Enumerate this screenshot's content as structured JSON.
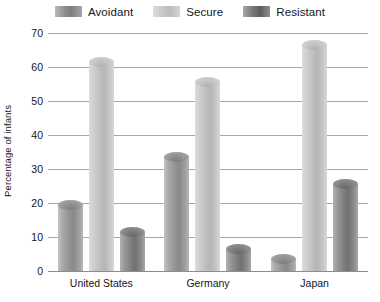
{
  "chart_data": {
    "type": "bar",
    "title": "",
    "subtitle": "",
    "xlabel": "",
    "ylabel": "Percentage of infants",
    "categories": [
      "United States",
      "Germany",
      "Japan"
    ],
    "series": [
      {
        "name": "Avoidant",
        "values": [
          21,
          35,
          5
        ]
      },
      {
        "name": "Secure",
        "values": [
          63,
          57,
          68
        ]
      },
      {
        "name": "Resistant",
        "values": [
          13,
          8,
          27
        ]
      }
    ],
    "ylim": [
      0,
      70
    ],
    "yticks": [
      70,
      60,
      50,
      40,
      30,
      20,
      10,
      0
    ],
    "grid": true,
    "legend_position": "top-center",
    "bar_style": "3d-cylinder",
    "colors": {
      "Avoidant": "#8f8f8f",
      "Secure": "#c4c4c4",
      "Resistant": "#767676",
      "gridline": "#a7a7a7",
      "text": "#161616",
      "background": "#ffffff"
    }
  }
}
